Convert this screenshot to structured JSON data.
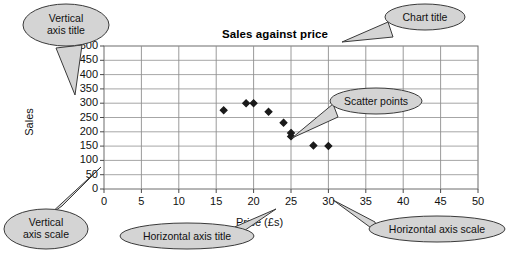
{
  "chart_data": {
    "type": "scatter",
    "title": "Sales against price",
    "xlabel": "Price (£s)",
    "ylabel": "Sales",
    "xlim": [
      0,
      50
    ],
    "ylim": [
      0,
      500
    ],
    "xticks": [
      "0",
      "5",
      "10",
      "15",
      "20",
      "25",
      "30",
      "35",
      "40",
      "45",
      "50"
    ],
    "yticks": [
      "0",
      "50",
      "100",
      "150",
      "200",
      "250",
      "300",
      "350",
      "400",
      "450",
      "500"
    ],
    "grid": true,
    "legend": "none",
    "marker": "diamond",
    "marker_color": "#1a1a1a",
    "points": [
      {
        "x": 16,
        "y": 275
      },
      {
        "x": 19,
        "y": 300
      },
      {
        "x": 20,
        "y": 300
      },
      {
        "x": 22,
        "y": 270
      },
      {
        "x": 24,
        "y": 232
      },
      {
        "x": 25,
        "y": 196
      },
      {
        "x": 25,
        "y": 184
      },
      {
        "x": 28,
        "y": 152
      },
      {
        "x": 30,
        "y": 150
      }
    ]
  },
  "annotations": {
    "vertical_axis_title": {
      "label": "Vertical\naxis title",
      "bubble": "ellipse"
    },
    "chart_title": {
      "label": "Chart title",
      "bubble": "ellipse"
    },
    "scatter_points": {
      "label": "Scatter points",
      "bubble": "ellipse"
    },
    "vertical_axis_scale": {
      "label": "Vertical\naxis scale",
      "bubble": "ellipse"
    },
    "horizontal_axis_title": {
      "label": "Horizontal axis title",
      "bubble": "ellipse"
    },
    "horizontal_axis_scale": {
      "label": "Horizontal axis scale",
      "bubble": "ellipse"
    }
  },
  "style": {
    "bubble_fill": "#d4d4d4",
    "bubble_stroke": "#3a3a3a",
    "grid_color": "#8f8f8f",
    "axis_color": "#4a4a4a",
    "background": "#ffffff"
  }
}
